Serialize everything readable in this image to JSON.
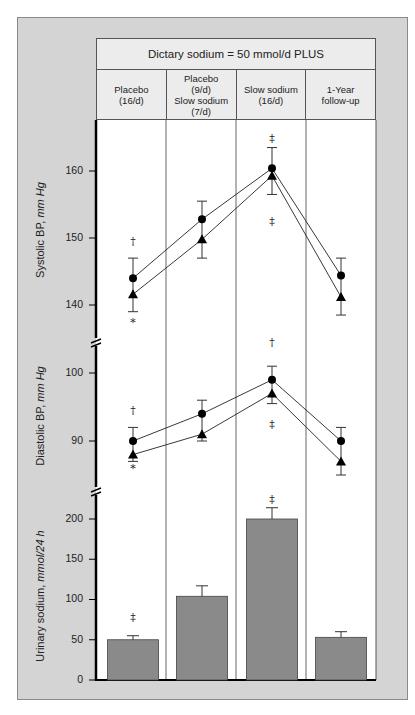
{
  "header": {
    "title": "Dictary sodium = 50 mmol/d PLUS",
    "columns": [
      "Placebo\n(16/d)",
      "Placebo\n(9/d)\nSlow sodium\n(7/d)",
      "Slow sodium\n(16/d)",
      "1-Year\nfollow-up"
    ]
  },
  "panels": {
    "systolic": {
      "label_main": "Systolic BP, ",
      "label_unit": "mm Hg",
      "ticks": [
        "160",
        "150",
        "140"
      ]
    },
    "diastolic": {
      "label_main": "Diastolic BP, ",
      "label_unit": "mm Hg",
      "ticks": [
        "100",
        "90"
      ]
    },
    "urinary": {
      "label_main": "Urinary sodium, ",
      "label_unit": "mmol/24 h",
      "ticks": [
        "200",
        "150",
        "100",
        "50",
        "0"
      ]
    }
  },
  "chart_data": [
    {
      "type": "line",
      "title": "Systolic BP",
      "ylabel": "Systolic BP, mm Hg",
      "categories": [
        "Placebo (16/d)",
        "Placebo (9/d) Slow sodium (7/d)",
        "Slow sodium (16/d)",
        "1-Year follow-up"
      ],
      "ylim": [
        137,
        166
      ],
      "yticks": [
        140,
        150,
        160
      ],
      "series": [
        {
          "name": "circle",
          "marker": "circle",
          "values": [
            144.0,
            152.8,
            160.4,
            144.4
          ],
          "err_upper": [
            147.0,
            155.5,
            163.5,
            147.0
          ]
        },
        {
          "name": "triangle",
          "marker": "triangle",
          "values": [
            141.6,
            149.8,
            159.3,
            141.2
          ],
          "err_lower": [
            139.0,
            147.0,
            156.5,
            138.5
          ]
        }
      ],
      "annotations": [
        {
          "category": 0,
          "symbol": "†",
          "position": "above",
          "value": 149.5
        },
        {
          "category": 0,
          "symbol": "*",
          "position": "below",
          "value": 137.5
        },
        {
          "category": 2,
          "symbol": "‡",
          "position": "above",
          "value": 165.0
        },
        {
          "category": 2,
          "symbol": "‡",
          "position": "below",
          "value": 152.5
        }
      ]
    },
    {
      "type": "line",
      "title": "Diastolic BP",
      "ylabel": "Diastolic BP, mm Hg",
      "categories": [
        "Placebo (16/d)",
        "Placebo (9/d) Slow sodium (7/d)",
        "Slow sodium (16/d)",
        "1-Year follow-up"
      ],
      "ylim": [
        83.5,
        104.5
      ],
      "yticks": [
        90,
        100
      ],
      "series": [
        {
          "name": "circle",
          "marker": "circle",
          "values": [
            90.0,
            94.0,
            99.0,
            90.0
          ],
          "err_upper": [
            92.0,
            96.0,
            101.0,
            92.0
          ]
        },
        {
          "name": "triangle",
          "marker": "triangle",
          "values": [
            88.0,
            91.0,
            97.0,
            87.0
          ],
          "err_lower": [
            87.0,
            90.0,
            95.5,
            85.0
          ]
        }
      ],
      "annotations": [
        {
          "category": 0,
          "symbol": "†",
          "position": "above",
          "value": 94.5
        },
        {
          "category": 0,
          "symbol": "*",
          "position": "below",
          "value": 86.0
        },
        {
          "category": 2,
          "symbol": "†",
          "position": "above",
          "value": 104.5
        },
        {
          "category": 2,
          "symbol": "‡",
          "position": "below",
          "value": 92.5
        }
      ]
    },
    {
      "type": "bar",
      "title": "Urinary sodium",
      "ylabel": "Urinary sodium, mmol/24 h",
      "categories": [
        "Placebo (16/d)",
        "Placebo (9/d) Slow sodium (7/d)",
        "Slow sodium (16/d)",
        "1-Year follow-up"
      ],
      "ylim": [
        0,
        200
      ],
      "yticks": [
        0,
        50,
        100,
        150,
        200
      ],
      "values": [
        50,
        104,
        200,
        53
      ],
      "err_upper": [
        55,
        117,
        214,
        60
      ],
      "annotations": [
        {
          "category": 0,
          "symbol": "‡",
          "position": "above",
          "value": 78
        },
        {
          "category": 2,
          "symbol": "‡",
          "position": "above",
          "value": 225
        }
      ],
      "bar_color": "#8a8a8a"
    }
  ]
}
